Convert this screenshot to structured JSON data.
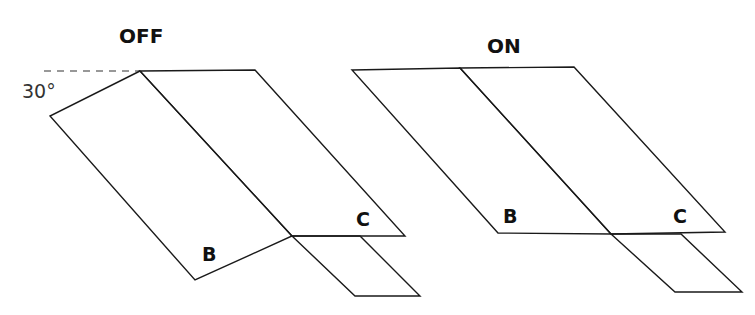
{
  "left": {
    "title": "OFF",
    "angle_label": "30°",
    "label_b": "B",
    "label_c": "C"
  },
  "right": {
    "title": "ON",
    "label_b": "B",
    "label_c": "C"
  },
  "colors": {
    "stroke": "#1a1a1a",
    "dash": "#777777"
  }
}
